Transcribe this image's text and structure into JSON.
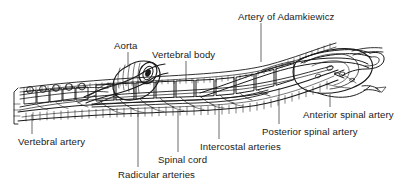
{
  "figure": {
    "type": "anatomical-illustration",
    "style": "black-and-white line drawing with leader-line callouts",
    "background_color": "#ffffff",
    "line_color": "#1a1a1a",
    "width": 416,
    "height": 196
  },
  "labels": [
    {
      "id": "aorta",
      "text": "Aorta",
      "x": 114,
      "y": 40,
      "leader": {
        "x1": 128,
        "y1": 52,
        "x2": 128,
        "y2": 66
      }
    },
    {
      "id": "vertebral-body",
      "text": "Vertebral body",
      "x": 152,
      "y": 49,
      "leader": {
        "x1": 186,
        "y1": 61,
        "x2": 186,
        "y2": 80
      }
    },
    {
      "id": "artery-of-adamkiewicz",
      "text": "Artery of Adamkiewicz",
      "x": 238,
      "y": 11,
      "leader": {
        "x1": 261,
        "y1": 23,
        "x2": 261,
        "y2": 62
      }
    },
    {
      "id": "anterior-spinal-artery",
      "text": "Anterior spinal artery",
      "x": 303,
      "y": 109,
      "leader": {
        "x1": 330,
        "y1": 107,
        "x2": 330,
        "y2": 94
      }
    },
    {
      "id": "posterior-spinal-artery",
      "text": "Posterior spinal artery",
      "x": 262,
      "y": 126,
      "leader": {
        "x1": 279,
        "y1": 124,
        "x2": 279,
        "y2": 88
      }
    },
    {
      "id": "intercostal-arteries",
      "text": "Intercostal arteries",
      "x": 200,
      "y": 141,
      "leader": {
        "x1": 219,
        "y1": 139,
        "x2": 219,
        "y2": 104
      }
    },
    {
      "id": "spinal-cord",
      "text": "Spinal cord",
      "x": 158,
      "y": 154,
      "leader": {
        "x1": 178,
        "y1": 152,
        "x2": 178,
        "y2": 110
      }
    },
    {
      "id": "radicular-arteries",
      "text": "Radicular arteries",
      "x": 118,
      "y": 169,
      "leader": {
        "x1": 138,
        "y1": 167,
        "x2": 138,
        "y2": 114
      }
    },
    {
      "id": "vertebral-artery",
      "text": "Vertebral artery",
      "x": 18,
      "y": 136,
      "leader": {
        "x1": 32,
        "y1": 134,
        "x2": 32,
        "y2": 114
      }
    }
  ]
}
